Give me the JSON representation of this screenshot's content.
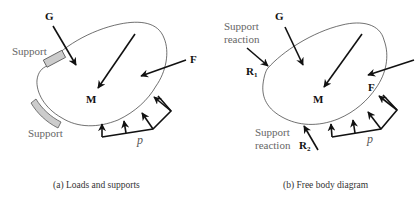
{
  "panel_a": {
    "caption": "(a) Loads and supports",
    "labels": {
      "G": "G",
      "M": "M",
      "F": "F",
      "p": "p",
      "support_top": "Support",
      "support_bottom": "Support"
    }
  },
  "panel_b": {
    "caption": "(b) Free body diagram",
    "labels": {
      "G": "G",
      "M": "M",
      "F": "F",
      "p": "p",
      "R1": "R",
      "R1_sub": "1",
      "R2": "R",
      "R2_sub": "2",
      "reaction_top_line1": "Support",
      "reaction_top_line2": "reaction",
      "reaction_bottom_line1": "Support",
      "reaction_bottom_line2": "reaction"
    }
  },
  "colors": {
    "outline": "#333333",
    "arrow": "#111111",
    "support_fill": "#cccccc",
    "label_gray": "#666666"
  }
}
